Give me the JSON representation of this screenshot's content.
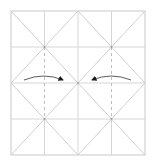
{
  "diagram": {
    "type": "origami-crease-pattern",
    "paper": {
      "x": 11,
      "y": 11,
      "width": 134,
      "height": 144
    },
    "grid": {
      "columns": 4,
      "rows": 4
    },
    "colors": {
      "border": "#c8c8c8",
      "grid_line": "#d4d4d4",
      "diagonal": "#cfcfcf",
      "valley_dashed": "#bdbdbd",
      "arrow": "#4a4a4a",
      "arrowhead": "#1a1a1a",
      "background": "#ffffff"
    },
    "arrows": [
      {
        "direction": "right",
        "from": [
          24,
          80
        ],
        "to": [
          63,
          80
        ]
      },
      {
        "direction": "left",
        "from": [
          131,
          80
        ],
        "to": [
          92,
          80
        ]
      }
    ]
  }
}
